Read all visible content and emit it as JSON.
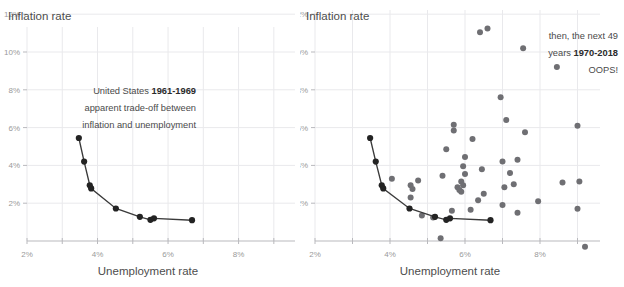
{
  "chart_data": [
    {
      "id": "left",
      "type": "scatter",
      "title": "",
      "xlabel": "Unemployment rate",
      "ylabel": "Inflation rate",
      "xlim": [
        2,
        9.6
      ],
      "ylim": [
        0,
        12.8
      ],
      "grid": true,
      "legend": "none",
      "x_ticks": [
        2,
        3,
        4,
        5,
        6,
        7,
        8,
        9
      ],
      "x_tick_labels": [
        "2%",
        "",
        "4%",
        "",
        "6%",
        "",
        "8%",
        ""
      ],
      "y_ticks": [
        2,
        4,
        6,
        8,
        10,
        12
      ],
      "y_tick_labels": [
        "2%",
        "4%",
        "6%",
        "8%",
        "10%",
        "12%"
      ],
      "series": [
        {
          "name": "United States 1961-1969",
          "connected": true,
          "color": "#232323",
          "points": [
            {
              "x": 3.47,
              "y": 5.45
            },
            {
              "x": 3.62,
              "y": 4.2
            },
            {
              "x": 3.78,
              "y": 2.95
            },
            {
              "x": 3.82,
              "y": 2.78
            },
            {
              "x": 4.52,
              "y": 1.72
            },
            {
              "x": 5.2,
              "y": 1.28
            },
            {
              "x": 5.5,
              "y": 1.12
            },
            {
              "x": 5.6,
              "y": 1.2
            },
            {
              "x": 6.68,
              "y": 1.1
            }
          ]
        }
      ],
      "annotations": [
        {
          "lines": [
            "United States ",
            "1961-1969"
          ],
          "bold_index": 1,
          "text": "United States 1961-1969"
        },
        {
          "text": "apparent trade-off between"
        },
        {
          "text": "inflation and unemployment"
        }
      ]
    },
    {
      "id": "right",
      "type": "scatter",
      "title": "",
      "xlabel": "Unemployment rate",
      "ylabel": "Inflation rate",
      "xlim": [
        2,
        9.6
      ],
      "ylim": [
        0,
        13.6
      ],
      "grid": true,
      "legend": "none",
      "x_ticks": [
        2,
        3,
        4,
        5,
        6,
        7,
        8,
        9
      ],
      "x_tick_labels": [
        "2%",
        "",
        "4%",
        "",
        "6%",
        "",
        "8%",
        ""
      ],
      "y_ticks": [
        2,
        4,
        6,
        8,
        10,
        12
      ],
      "y_tick_labels": [
        "2%",
        "4%",
        "6%",
        "8%",
        "10%",
        "12%"
      ],
      "series": [
        {
          "name": "United States 1961-1969",
          "connected": true,
          "color": "#232323",
          "points": [
            {
              "x": 3.47,
              "y": 5.45
            },
            {
              "x": 3.62,
              "y": 4.2
            },
            {
              "x": 3.78,
              "y": 2.95
            },
            {
              "x": 3.82,
              "y": 2.78
            },
            {
              "x": 4.52,
              "y": 1.72
            },
            {
              "x": 5.2,
              "y": 1.28
            },
            {
              "x": 5.5,
              "y": 1.12
            },
            {
              "x": 5.6,
              "y": 1.2
            },
            {
              "x": 6.68,
              "y": 1.1
            }
          ]
        },
        {
          "name": "United States 1970-2018",
          "connected": false,
          "color": "#6f6f73",
          "points": [
            {
              "x": 7.05,
              "y": 13.3
            },
            {
              "x": 6.4,
              "y": 11.05
            },
            {
              "x": 6.6,
              "y": 11.25
            },
            {
              "x": 7.55,
              "y": 10.2
            },
            {
              "x": 8.45,
              "y": 9.2
            },
            {
              "x": 6.95,
              "y": 7.6
            },
            {
              "x": 5.7,
              "y": 6.15
            },
            {
              "x": 5.7,
              "y": 5.85
            },
            {
              "x": 9.0,
              "y": 6.1
            },
            {
              "x": 7.1,
              "y": 6.4
            },
            {
              "x": 7.6,
              "y": 5.75
            },
            {
              "x": 6.2,
              "y": 5.4
            },
            {
              "x": 5.5,
              "y": 4.85
            },
            {
              "x": 6.0,
              "y": 4.45
            },
            {
              "x": 7.4,
              "y": 4.3
            },
            {
              "x": 7.0,
              "y": 4.2
            },
            {
              "x": 5.95,
              "y": 3.95
            },
            {
              "x": 6.45,
              "y": 3.8
            },
            {
              "x": 6.0,
              "y": 3.55
            },
            {
              "x": 7.2,
              "y": 3.6
            },
            {
              "x": 5.4,
              "y": 3.45
            },
            {
              "x": 4.05,
              "y": 3.3
            },
            {
              "x": 4.75,
              "y": 3.2
            },
            {
              "x": 5.9,
              "y": 3.15
            },
            {
              "x": 5.95,
              "y": 2.95
            },
            {
              "x": 8.6,
              "y": 3.1
            },
            {
              "x": 9.05,
              "y": 3.15
            },
            {
              "x": 4.55,
              "y": 2.95
            },
            {
              "x": 4.6,
              "y": 2.75
            },
            {
              "x": 5.8,
              "y": 2.85
            },
            {
              "x": 5.85,
              "y": 2.7
            },
            {
              "x": 5.9,
              "y": 2.6
            },
            {
              "x": 7.3,
              "y": 3.0
            },
            {
              "x": 7.05,
              "y": 2.85
            },
            {
              "x": 6.5,
              "y": 2.5
            },
            {
              "x": 4.55,
              "y": 2.3
            },
            {
              "x": 6.35,
              "y": 2.15
            },
            {
              "x": 7.95,
              "y": 2.1
            },
            {
              "x": 7.0,
              "y": 1.9
            },
            {
              "x": 6.15,
              "y": 1.65
            },
            {
              "x": 5.65,
              "y": 1.6
            },
            {
              "x": 7.4,
              "y": 1.5
            },
            {
              "x": 9.0,
              "y": 1.7
            },
            {
              "x": 4.85,
              "y": 1.35
            },
            {
              "x": 5.15,
              "y": 1.25
            },
            {
              "x": 5.35,
              "y": 0.15
            },
            {
              "x": 9.2,
              "y": -0.3
            }
          ]
        }
      ],
      "annotations": [
        {
          "text": "then, the next 49"
        },
        {
          "text": "years 1970-2018",
          "bold_part": "1970-2018"
        },
        {
          "text": "OOPS!"
        }
      ]
    }
  ],
  "left_chart": {
    "y_axis_title": "Inflation rate",
    "x_axis_title": "Unemployment rate",
    "y_tick_labels": [
      "12%",
      "10%",
      "8%",
      "6%",
      "4%",
      "2%"
    ],
    "x_tick_labels": [
      "2%",
      "4%",
      "6%",
      "8%"
    ],
    "annotation": {
      "line1_plain": "United States ",
      "line1_bold": "1961-1969",
      "line2": "apparent trade-off between",
      "line3": "inflation and unemployment"
    }
  },
  "right_chart": {
    "y_axis_title": "Inflation rate",
    "x_axis_title": "Unemployment rate",
    "y_tick_labels": [
      "12%",
      "10%",
      "8%",
      "6%",
      "4%",
      "2%"
    ],
    "x_tick_labels": [
      "2%",
      "4%",
      "6%",
      "8%"
    ],
    "annotation": {
      "line1": "then, the next 49",
      "line2_plain": "years ",
      "line2_bold": "1970-2018",
      "line3": "OOPS!"
    }
  },
  "colors": {
    "grid": "#e9e9ec",
    "axis": "#b9b9bd",
    "tick_text": "#9a9a9a",
    "axis_title": "#4d4d4d",
    "series_1961": "#232323",
    "series_1970": "#6f6f73",
    "annotation_text": "#4a4a4a",
    "background": "#ffffff"
  }
}
